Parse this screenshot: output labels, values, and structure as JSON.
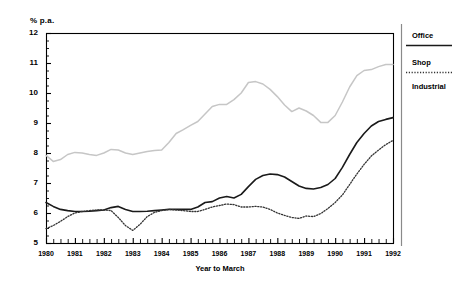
{
  "chart_data": {
    "type": "line",
    "title": "",
    "xlabel": "Year to March",
    "ylabel": "% p.a.",
    "ylim": [
      5,
      12
    ],
    "xlim": [
      1980,
      1992
    ],
    "grid": false,
    "legend_position": "right",
    "y_ticks": [
      "5",
      "6",
      "7",
      "8",
      "9",
      "10",
      "11",
      "12"
    ],
    "y_minor_ticks_per_interval": 4,
    "x_ticks": [
      "1980",
      "1981",
      "1982",
      "1983",
      "1984",
      "1985",
      "1986",
      "1987",
      "1988",
      "1989",
      "1990",
      "1991",
      "1992"
    ],
    "x_minor_ticks_per_interval": 4,
    "x_quarterly": true,
    "series": [
      {
        "name": "Office",
        "style": "solid",
        "color": "#1a1a1a",
        "width": 1.6,
        "x": [
          1980.0,
          1980.25,
          1980.5,
          1980.75,
          1981.0,
          1981.25,
          1981.5,
          1981.75,
          1982.0,
          1982.25,
          1982.5,
          1982.75,
          1983.0,
          1983.25,
          1983.5,
          1983.75,
          1984.0,
          1984.25,
          1984.5,
          1984.75,
          1985.0,
          1985.25,
          1985.5,
          1985.75,
          1986.0,
          1986.25,
          1986.5,
          1986.75,
          1987.0,
          1987.25,
          1987.5,
          1987.75,
          1988.0,
          1988.25,
          1988.5,
          1988.75,
          1989.0,
          1989.25,
          1989.5,
          1989.75,
          1990.0,
          1990.25,
          1990.5,
          1990.75,
          1991.0,
          1991.25,
          1991.5,
          1991.75,
          1992.0
        ],
        "values": [
          6.35,
          6.22,
          6.12,
          6.08,
          6.05,
          6.05,
          6.06,
          6.08,
          6.1,
          6.18,
          6.22,
          6.12,
          6.05,
          6.05,
          6.06,
          6.08,
          6.1,
          6.12,
          6.12,
          6.12,
          6.12,
          6.2,
          6.35,
          6.38,
          6.5,
          6.55,
          6.5,
          6.62,
          6.88,
          7.12,
          7.25,
          7.3,
          7.28,
          7.2,
          7.05,
          6.9,
          6.82,
          6.8,
          6.85,
          6.95,
          7.15,
          7.52,
          7.95,
          8.35,
          8.65,
          8.9,
          9.05,
          9.12,
          9.18
        ]
      },
      {
        "name": "Shop",
        "style": "dotted",
        "color": "#333333",
        "width": 1.3,
        "x": [
          1980.0,
          1980.25,
          1980.5,
          1980.75,
          1981.0,
          1981.25,
          1981.5,
          1981.75,
          1982.0,
          1982.25,
          1982.5,
          1982.75,
          1983.0,
          1983.25,
          1983.5,
          1983.75,
          1984.0,
          1984.25,
          1984.5,
          1984.75,
          1985.0,
          1985.25,
          1985.5,
          1985.75,
          1986.0,
          1986.25,
          1986.5,
          1986.75,
          1987.0,
          1987.25,
          1987.5,
          1987.75,
          1988.0,
          1988.25,
          1988.5,
          1988.75,
          1989.0,
          1989.25,
          1989.5,
          1989.75,
          1990.0,
          1990.25,
          1990.5,
          1990.75,
          1991.0,
          1991.25,
          1991.5,
          1991.75,
          1992.0
        ],
        "values": [
          5.48,
          5.58,
          5.72,
          5.88,
          6.0,
          6.05,
          6.08,
          6.1,
          6.1,
          6.08,
          5.85,
          5.58,
          5.42,
          5.62,
          5.88,
          6.02,
          6.08,
          6.12,
          6.1,
          6.08,
          6.05,
          6.05,
          6.12,
          6.2,
          6.25,
          6.3,
          6.28,
          6.2,
          6.2,
          6.22,
          6.2,
          6.12,
          6.0,
          5.92,
          5.85,
          5.82,
          5.9,
          5.88,
          5.98,
          6.15,
          6.35,
          6.6,
          6.95,
          7.3,
          7.62,
          7.9,
          8.1,
          8.28,
          8.42
        ]
      },
      {
        "name": "Industrial",
        "style": "solid",
        "color": "#c6c6c6",
        "width": 1.5,
        "x": [
          1980.0,
          1980.25,
          1980.5,
          1980.75,
          1981.0,
          1981.25,
          1981.5,
          1981.75,
          1982.0,
          1982.25,
          1982.5,
          1982.75,
          1983.0,
          1983.25,
          1983.5,
          1983.75,
          1984.0,
          1984.25,
          1984.5,
          1984.75,
          1985.0,
          1985.25,
          1985.5,
          1985.75,
          1986.0,
          1986.25,
          1986.5,
          1986.75,
          1987.0,
          1987.25,
          1987.5,
          1987.75,
          1988.0,
          1988.25,
          1988.5,
          1988.75,
          1989.0,
          1989.25,
          1989.5,
          1989.75,
          1990.0,
          1990.25,
          1990.5,
          1990.75,
          1991.0,
          1991.25,
          1991.5,
          1991.75,
          1992.0
        ],
        "values": [
          7.92,
          7.72,
          7.78,
          7.95,
          8.02,
          8.0,
          7.95,
          7.92,
          8.0,
          8.12,
          8.1,
          8.0,
          7.95,
          8.0,
          8.05,
          8.08,
          8.1,
          8.35,
          8.65,
          8.78,
          8.92,
          9.05,
          9.3,
          9.55,
          9.62,
          9.62,
          9.78,
          10.0,
          10.35,
          10.38,
          10.3,
          10.12,
          9.88,
          9.6,
          9.38,
          9.5,
          9.4,
          9.25,
          9.02,
          9.02,
          9.25,
          9.7,
          10.2,
          10.58,
          10.75,
          10.78,
          10.88,
          10.95,
          10.95
        ]
      }
    ]
  },
  "legend": {
    "items": [
      {
        "label": "Office",
        "style": "solid-dark"
      },
      {
        "label": "Shop",
        "style": "dotted"
      },
      {
        "label": "Industrial",
        "style": "solid-light"
      }
    ]
  }
}
